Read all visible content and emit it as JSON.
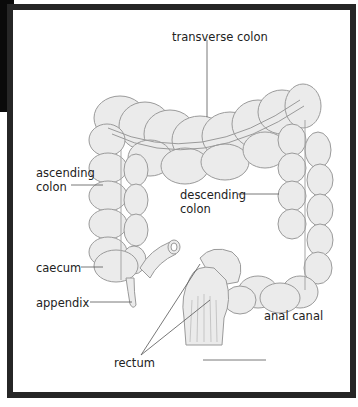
{
  "diagram": {
    "labels": {
      "transverse_colon": "transverse colon",
      "ascending_colon_line1": "ascending",
      "ascending_colon_line2": "colon",
      "descending_colon_line1": "descending",
      "descending_colon_line2": "colon",
      "caecum": "caecum",
      "appendix": "appendix",
      "anal_canal": "anal canal",
      "rectum": "rectum"
    },
    "colors": {
      "frame": "#262626",
      "organ_fill": "#ebebeb",
      "organ_stroke": "#9a9a9a",
      "leader_line": "#555555",
      "text": "#222222"
    }
  }
}
